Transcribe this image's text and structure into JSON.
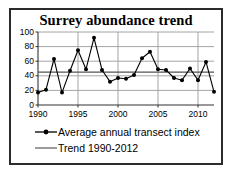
{
  "figure": {
    "border_color": "#2b2b2b",
    "background": "#ffffff"
  },
  "chart_data": {
    "type": "line",
    "title": "Surrey abundance trend",
    "xlabel": "",
    "ylabel": "",
    "x": [
      1990,
      1991,
      1992,
      1993,
      1994,
      1995,
      1996,
      1997,
      1998,
      1999,
      2000,
      2001,
      2002,
      2003,
      2004,
      2005,
      2006,
      2007,
      2008,
      2009,
      2010,
      2011,
      2012
    ],
    "categories": [
      "1990",
      "1991",
      "1992",
      "1993",
      "1994",
      "1995",
      "1996",
      "1997",
      "1998",
      "1999",
      "2000",
      "2001",
      "2002",
      "2003",
      "2004",
      "2005",
      "2006",
      "2007",
      "2008",
      "2009",
      "2010",
      "2011",
      "2012"
    ],
    "series": [
      {
        "name": "Average annual transect index",
        "type": "line-marker",
        "color": "#000000",
        "marker": "filled-circle",
        "values": [
          17,
          21,
          63,
          17,
          47,
          75,
          49,
          92,
          48,
          32,
          37,
          36,
          41,
          64,
          73,
          49,
          48,
          37,
          34,
          50,
          34,
          59,
          18
        ]
      },
      {
        "name": "Trend 1990-2012",
        "type": "line",
        "color": "#555555",
        "marker": "none",
        "values": [
          45,
          45,
          45,
          45,
          45,
          45,
          45,
          45,
          45,
          45,
          45,
          45,
          45,
          45,
          45,
          45,
          45,
          45,
          45,
          45,
          45,
          45,
          45
        ]
      }
    ],
    "xlim": [
      1990,
      2012
    ],
    "ylim": [
      0,
      100
    ],
    "yticks": [
      0,
      20,
      40,
      60,
      80,
      100
    ],
    "ytick_labels": [
      "0",
      "20",
      "40",
      "60",
      "80",
      "100"
    ],
    "xticks": [
      1990,
      1995,
      2000,
      2005,
      2010
    ],
    "xtick_labels": [
      "1990",
      "1995",
      "2000",
      "2005",
      "2010"
    ],
    "grid": {
      "horizontal": true,
      "vertical": true,
      "color": "#9a9a9a"
    },
    "legend": {
      "position": "bottom",
      "entries": [
        {
          "label": "Average annual transect index",
          "marker": "line-marker"
        },
        {
          "label": "Trend 1990-2012",
          "marker": "line"
        }
      ]
    }
  }
}
